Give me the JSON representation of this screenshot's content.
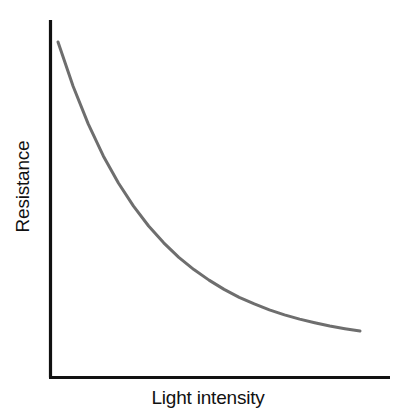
{
  "figure": {
    "background_color": "#ffffff",
    "axis_color": "#111111",
    "curve_color": "#6e6e6e"
  },
  "labels": {
    "x_axis": "Light intensity",
    "y_axis": "Resistance"
  },
  "chart_data": {
    "type": "line",
    "title": "",
    "subtitle": "",
    "xlabel": "Light intensity",
    "ylabel": "Resistance",
    "xlim": [
      0,
      1
    ],
    "ylim": [
      0,
      1
    ],
    "grid": false,
    "legend": null,
    "axis_ticks": {
      "x": [],
      "y": []
    },
    "annotations": [],
    "series": [
      {
        "name": "Resistance vs light intensity",
        "color": "#6e6e6e",
        "line_width": 3,
        "x": [
          0.0,
          0.05,
          0.1,
          0.15,
          0.2,
          0.25,
          0.3,
          0.35,
          0.4,
          0.45,
          0.5,
          0.55,
          0.6,
          0.65,
          0.7,
          0.75,
          0.8,
          0.85,
          0.9,
          0.95,
          1.0
        ],
        "values": [
          1.0,
          0.866,
          0.752,
          0.655,
          0.573,
          0.503,
          0.443,
          0.392,
          0.348,
          0.311,
          0.279,
          0.251,
          0.227,
          0.207,
          0.189,
          0.174,
          0.161,
          0.15,
          0.14,
          0.132,
          0.125
        ]
      }
    ]
  }
}
